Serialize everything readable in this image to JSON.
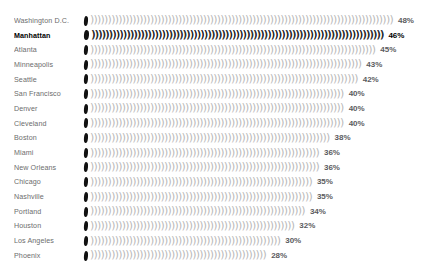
{
  "chart_data": {
    "type": "bar",
    "style": "pictogram-glyph-bars",
    "title": "",
    "xlabel": "",
    "ylabel": "",
    "unit": "%",
    "xlim": [
      0,
      50
    ],
    "grid": false,
    "legend": false,
    "highlight_category": "Manhattan",
    "glyph": ")",
    "categories": [
      "Washington D.C.",
      "Manhattan",
      "Atlanta",
      "Minneapolis",
      "Seattle",
      "San Francisco",
      "Denver",
      "Cleveland",
      "Boston",
      "Miami",
      "New Orleans",
      "Chicago",
      "Nashville",
      "Portland",
      "Houston",
      "Los Angeles",
      "Phoenix"
    ],
    "values": [
      48,
      46,
      45,
      43,
      42,
      40,
      40,
      40,
      38,
      36,
      36,
      35,
      35,
      34,
      32,
      30,
      28
    ],
    "value_labels": [
      "48%",
      "46%",
      "45%",
      "43%",
      "42%",
      "40%",
      "40%",
      "40%",
      "38%",
      "36%",
      "36%",
      "35%",
      "35%",
      "34%",
      "32%",
      "30%",
      "28%"
    ],
    "colors": {
      "background": "#ffffff",
      "bar": "#b9b9b9",
      "bar_highlight": "#222222",
      "lead_marker": "#111111",
      "label": "#6d6d6d",
      "value": "#5b5b5e",
      "highlight_text": "#000000"
    }
  }
}
